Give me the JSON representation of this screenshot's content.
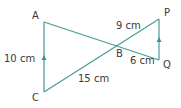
{
  "diagram": {
    "type": "geometry-similar-triangles",
    "line_color": "#4a9a98",
    "points": {
      "A": {
        "label": "A",
        "x": 44,
        "y": 22
      },
      "B": {
        "label": "B",
        "x": 117,
        "y": 44
      },
      "C": {
        "label": "C",
        "x": 44,
        "y": 92
      },
      "P": {
        "label": "P",
        "x": 159,
        "y": 19
      },
      "Q": {
        "label": "Q",
        "x": 159,
        "y": 60
      }
    },
    "measurements": {
      "AC": "10 cm",
      "BP": "9 cm",
      "BQ": "6 cm",
      "BC": "15 cm"
    },
    "parallel_marks": [
      "AC",
      "QP"
    ]
  }
}
